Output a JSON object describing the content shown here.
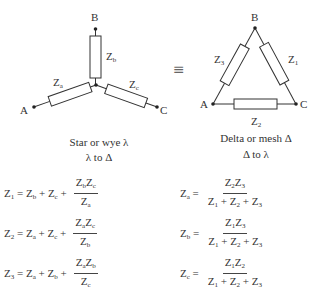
{
  "star": {
    "title": "Star or wye λ",
    "nodes": {
      "A": "A",
      "B": "B",
      "C": "C"
    },
    "impedances": {
      "a": "Z_a",
      "b": "Z_b",
      "c": "Z_c"
    },
    "conversion_label": "λ to Δ"
  },
  "equivalence_symbol": "≡",
  "delta": {
    "title": "Delta or mesh Δ",
    "nodes": {
      "A": "A",
      "B": "B",
      "C": "C"
    },
    "impedances": {
      "1": "Z_1",
      "2": "Z_2",
      "3": "Z_3"
    },
    "conversion_label": "Δ to λ"
  },
  "formulas": {
    "star_to_delta": [
      {
        "lhs": "Z1",
        "rhs": "Zb + Zc + ZbZc / Za"
      },
      {
        "lhs": "Z2",
        "rhs": "Za + Zc + ZaZc / Zb"
      },
      {
        "lhs": "Z3",
        "rhs": "Za + Zb + ZaZb / Zc"
      }
    ],
    "delta_to_star": [
      {
        "lhs": "Za",
        "rhs": "Z2Z3 / (Z1 + Z2 + Z3)"
      },
      {
        "lhs": "Zb",
        "rhs": "Z1Z3 / (Z1 + Z2 + Z3)"
      },
      {
        "lhs": "Zc",
        "rhs": "Z1Z2 / (Z1 + Z2 + Z3)"
      }
    ]
  },
  "colors": {
    "line": "#333333",
    "text": "#2a2a2a",
    "background": "#ffffff"
  }
}
